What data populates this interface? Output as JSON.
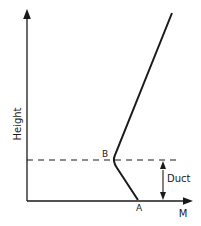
{
  "diagram": {
    "y_axis_label": "Height",
    "x_axis_label": "M",
    "point_a_label": "A",
    "point_b_label": "B",
    "duct_label": "Duct",
    "colors": {
      "line": "#1a1a1a",
      "background": "#ffffff"
    },
    "profile_points": [
      {
        "name": "A",
        "x": 138,
        "y": 200
      },
      {
        "name": "B",
        "x": 113,
        "y": 160
      },
      {
        "name": "top",
        "x": 172,
        "y": 13
      }
    ]
  }
}
